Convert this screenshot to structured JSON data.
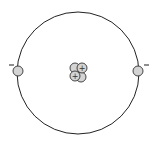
{
  "diagram": {
    "orbit": {
      "cx": 78,
      "cy": 73,
      "r": 61
    },
    "electrons": [
      {
        "cx": 18,
        "cy": 71,
        "charge": "-"
      },
      {
        "cx": 138,
        "cy": 71,
        "charge": "-"
      }
    ],
    "nucleus": {
      "protons": 2,
      "neutrons": 2,
      "proton_symbol": "+"
    },
    "colors": {
      "stroke": "#222222",
      "particle_fill": "#d4d4d4",
      "background": "#ffffff"
    }
  }
}
